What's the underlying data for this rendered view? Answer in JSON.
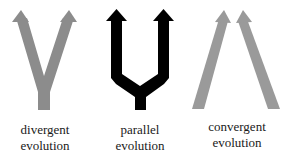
{
  "colors": {
    "divergent": "#8c8c8c",
    "parallel": "#000000",
    "convergent": "#9a9a9a",
    "text": "#1a1a1a"
  },
  "panels": [
    {
      "id": "divergent",
      "line1": "divergent",
      "line2": "evolution"
    },
    {
      "id": "parallel",
      "line1": "parallel",
      "line2": "evolution"
    },
    {
      "id": "convergent",
      "line1": "convergent",
      "line2": "evolution"
    }
  ]
}
